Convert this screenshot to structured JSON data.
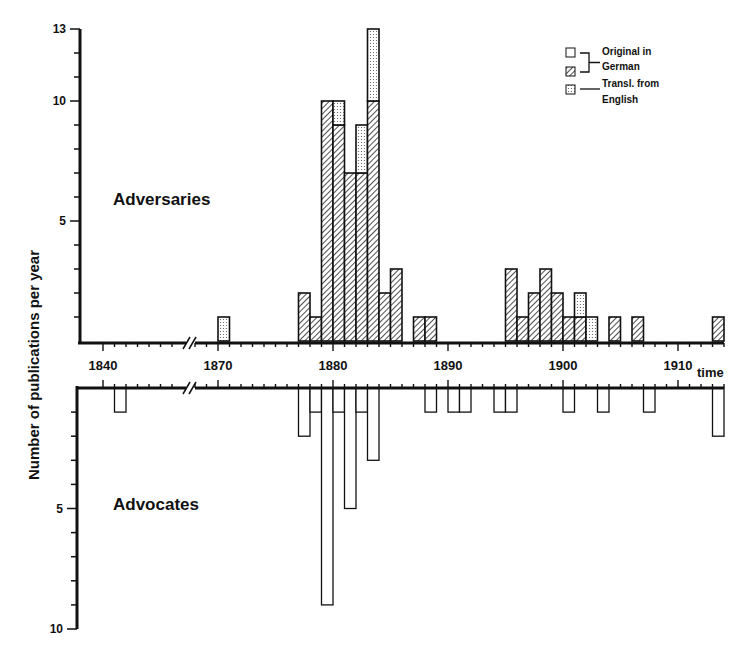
{
  "chart_data": {
    "type": "bar",
    "title": "",
    "ylabel": "Number of publications per year",
    "xlabel": "time",
    "x_ticks": [
      1840,
      1870,
      1880,
      1890,
      1900,
      1910
    ],
    "axis_break": "between 1845 and 1868",
    "panels": [
      {
        "name": "Adversaries",
        "direction": "up",
        "ylim": [
          0,
          13
        ],
        "y_ticks": [
          5,
          10,
          13
        ],
        "series": [
          {
            "name": "Original in German",
            "pattern": "hatched",
            "points": [
              [
                1877,
                2
              ],
              [
                1878,
                1
              ],
              [
                1879,
                10
              ],
              [
                1880,
                9
              ],
              [
                1881,
                7
              ],
              [
                1882,
                7
              ],
              [
                1883,
                10
              ],
              [
                1884,
                2
              ],
              [
                1885,
                3
              ],
              [
                1887,
                1
              ],
              [
                1888,
                1
              ],
              [
                1895,
                3
              ],
              [
                1896,
                1
              ],
              [
                1897,
                2
              ],
              [
                1898,
                3
              ],
              [
                1899,
                2
              ],
              [
                1900,
                1
              ],
              [
                1901,
                1
              ],
              [
                1904,
                1
              ],
              [
                1906,
                1
              ],
              [
                1913,
                1
              ]
            ]
          },
          {
            "name": "Transl. from English",
            "pattern": "dotted",
            "points": [
              [
                1870,
                1
              ],
              [
                1880,
                1
              ],
              [
                1882,
                2
              ],
              [
                1883,
                3
              ],
              [
                1901,
                1
              ],
              [
                1902,
                1
              ]
            ]
          }
        ],
        "totals": [
          [
            1870,
            1
          ],
          [
            1877,
            2
          ],
          [
            1878,
            1
          ],
          [
            1879,
            10
          ],
          [
            1880,
            10
          ],
          [
            1881,
            7
          ],
          [
            1882,
            9
          ],
          [
            1883,
            13
          ],
          [
            1884,
            2
          ],
          [
            1885,
            3
          ],
          [
            1887,
            1
          ],
          [
            1888,
            1
          ],
          [
            1895,
            3
          ],
          [
            1896,
            1
          ],
          [
            1897,
            2
          ],
          [
            1898,
            3
          ],
          [
            1899,
            2
          ],
          [
            1900,
            1
          ],
          [
            1901,
            2
          ],
          [
            1902,
            1
          ],
          [
            1904,
            1
          ],
          [
            1906,
            1
          ],
          [
            1913,
            1
          ]
        ]
      },
      {
        "name": "Advocates",
        "direction": "down",
        "ylim": [
          0,
          10
        ],
        "y_ticks": [
          5,
          10
        ],
        "series": [
          {
            "name": "Original in German",
            "pattern": "open",
            "points": [
              [
                1841,
                1
              ],
              [
                1877,
                2
              ],
              [
                1878,
                1
              ],
              [
                1879,
                9
              ],
              [
                1880,
                1
              ],
              [
                1881,
                5
              ],
              [
                1882,
                1
              ],
              [
                1883,
                3
              ],
              [
                1888,
                1
              ],
              [
                1890,
                1
              ],
              [
                1891,
                1
              ],
              [
                1894,
                1
              ],
              [
                1895,
                1
              ],
              [
                1900,
                1
              ],
              [
                1903,
                1
              ],
              [
                1907,
                1
              ],
              [
                1913,
                2
              ]
            ]
          }
        ]
      }
    ],
    "legend": {
      "position": "top-right",
      "entries": [
        {
          "pattern": "open",
          "label": "Original in German"
        },
        {
          "pattern": "hatched",
          "label": "Original in German"
        },
        {
          "pattern": "dotted",
          "label": "Transl. from English"
        }
      ]
    }
  },
  "labels": {
    "ylabel": "Number of publications per year",
    "adversaries": "Adversaries",
    "advocates": "Advocates",
    "time": "time",
    "legend_line1": "Original in",
    "legend_line2": "German",
    "legend_line3": "Transl. from",
    "legend_line4": "English"
  }
}
